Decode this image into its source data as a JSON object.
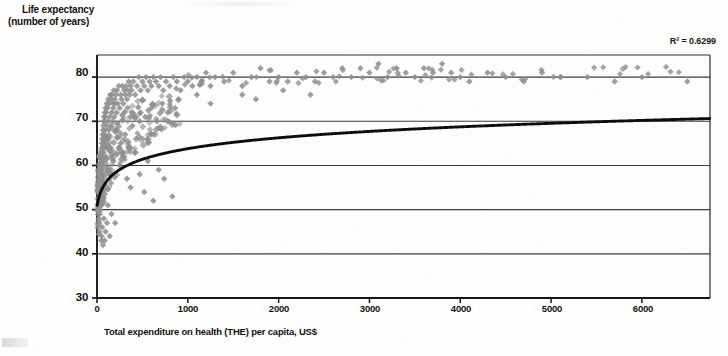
{
  "chart_data": {
    "type": "scatter",
    "title": "",
    "ylabel_lines": [
      "Life expectancy",
      "(number of years)"
    ],
    "xlabel": "Total expenditure on health (THE) per capita, US$",
    "annotation": "R² = 0.6299",
    "xlim": [
      0,
      6750
    ],
    "ylim": [
      30,
      85
    ],
    "xticks": [
      0,
      1000,
      2000,
      3000,
      4000,
      5000,
      6000
    ],
    "xticklabels": [
      "0",
      "1000",
      "2000",
      "3000",
      "4000",
      "5000",
      "6000"
    ],
    "yticks": [
      30,
      40,
      50,
      60,
      70,
      80
    ],
    "yticklabels": [
      "30",
      "40",
      "50",
      "60",
      "70",
      "80"
    ],
    "grid": "horizontal",
    "legend": "none",
    "marker": "diamond",
    "marker_color": "#8f8f8f",
    "trend_color": "#111111",
    "trend_type": "logarithmic",
    "series": [
      {
        "name": "Countries",
        "points": [
          [
            15,
            46.5
          ],
          [
            18,
            48
          ],
          [
            20,
            44.5
          ],
          [
            22,
            50
          ],
          [
            24,
            47
          ],
          [
            26,
            52
          ],
          [
            28,
            45
          ],
          [
            30,
            54
          ],
          [
            32,
            49
          ],
          [
            34,
            56
          ],
          [
            36,
            51
          ],
          [
            38,
            58
          ],
          [
            40,
            53
          ],
          [
            42,
            60
          ],
          [
            44,
            55
          ],
          [
            46,
            62
          ],
          [
            48,
            57
          ],
          [
            50,
            63
          ],
          [
            52,
            59
          ],
          [
            54,
            65
          ],
          [
            56,
            61
          ],
          [
            58,
            66
          ],
          [
            60,
            58
          ],
          [
            62,
            67
          ],
          [
            64,
            63
          ],
          [
            66,
            68
          ],
          [
            68,
            60
          ],
          [
            70,
            69
          ],
          [
            72,
            64
          ],
          [
            74,
            70
          ],
          [
            76,
            66
          ],
          [
            78,
            71
          ],
          [
            80,
            62
          ],
          [
            82,
            70
          ],
          [
            84,
            67
          ],
          [
            86,
            72
          ],
          [
            88,
            65
          ],
          [
            90,
            71
          ],
          [
            92,
            68
          ],
          [
            95,
            73
          ],
          [
            98,
            64
          ],
          [
            100,
            72
          ],
          [
            104,
            69
          ],
          [
            108,
            74
          ],
          [
            112,
            66
          ],
          [
            116,
            73
          ],
          [
            120,
            70
          ],
          [
            125,
            75
          ],
          [
            130,
            68
          ],
          [
            135,
            74
          ],
          [
            140,
            71
          ],
          [
            145,
            76
          ],
          [
            150,
            69
          ],
          [
            155,
            75
          ],
          [
            160,
            72
          ],
          [
            165,
            76
          ],
          [
            170,
            70
          ],
          [
            175,
            74
          ],
          [
            180,
            73
          ],
          [
            185,
            77
          ],
          [
            190,
            71
          ],
          [
            195,
            75
          ],
          [
            200,
            74
          ],
          [
            210,
            76
          ],
          [
            215,
            72
          ],
          [
            220,
            77
          ],
          [
            230,
            74
          ],
          [
            240,
            78
          ],
          [
            250,
            73
          ],
          [
            260,
            76
          ],
          [
            270,
            75
          ],
          [
            280,
            78
          ],
          [
            290,
            74
          ],
          [
            300,
            77
          ],
          [
            310,
            76
          ],
          [
            320,
            78
          ],
          [
            330,
            75
          ],
          [
            340,
            77
          ],
          [
            350,
            79
          ],
          [
            360,
            76
          ],
          [
            370,
            78
          ],
          [
            380,
            77
          ],
          [
            400,
            79
          ],
          [
            420,
            76
          ],
          [
            440,
            78
          ],
          [
            460,
            80
          ],
          [
            480,
            77
          ],
          [
            500,
            79
          ],
          [
            520,
            78
          ],
          [
            540,
            80
          ],
          [
            560,
            77
          ],
          [
            580,
            79
          ],
          [
            600,
            78
          ],
          [
            620,
            80
          ],
          [
            650,
            79
          ],
          [
            680,
            78
          ],
          [
            700,
            80
          ],
          [
            730,
            77
          ],
          [
            760,
            79
          ],
          [
            800,
            78
          ],
          [
            840,
            80
          ],
          [
            880,
            79
          ],
          [
            920,
            77
          ],
          [
            960,
            80
          ],
          [
            1000,
            79
          ],
          [
            1050,
            78
          ],
          [
            1100,
            80
          ],
          [
            1150,
            79
          ],
          [
            1200,
            81
          ],
          [
            1250,
            78
          ],
          [
            1300,
            80
          ],
          [
            1400,
            79
          ],
          [
            1500,
            81
          ],
          [
            1600,
            78
          ],
          [
            1700,
            80
          ],
          [
            1800,
            82
          ],
          [
            1900,
            79
          ],
          [
            2000,
            80
          ],
          [
            2100,
            79
          ],
          [
            2200,
            81
          ],
          [
            2300,
            80
          ],
          [
            2400,
            79
          ],
          [
            2500,
            81
          ],
          [
            2600,
            80
          ],
          [
            2700,
            82
          ],
          [
            2800,
            80
          ],
          [
            2900,
            82
          ],
          [
            3000,
            81
          ],
          [
            3100,
            83
          ],
          [
            3200,
            80
          ],
          [
            3300,
            82
          ],
          [
            3400,
            81
          ],
          [
            3500,
            80
          ],
          [
            3600,
            82
          ],
          [
            3700,
            81
          ],
          [
            3800,
            83
          ],
          [
            3900,
            81
          ],
          [
            4000,
            80
          ],
          [
            4100,
            79
          ],
          [
            4300,
            81
          ],
          [
            4500,
            80
          ],
          [
            4700,
            79
          ],
          [
            4900,
            81
          ],
          [
            5100,
            80
          ],
          [
            5400,
            80
          ],
          [
            5700,
            79
          ],
          [
            6000,
            80
          ],
          [
            6500,
            79
          ],
          [
            250,
            60
          ],
          [
            300,
            62
          ],
          [
            330,
            57
          ],
          [
            370,
            55
          ],
          [
            420,
            63
          ],
          [
            470,
            58
          ],
          [
            520,
            54
          ],
          [
            560,
            61
          ],
          [
            620,
            52
          ],
          [
            680,
            59
          ],
          [
            740,
            57
          ],
          [
            830,
            53
          ],
          [
            160,
            49
          ],
          [
            200,
            47
          ],
          [
            120,
            51
          ],
          [
            95,
            45
          ],
          [
            140,
            58
          ],
          [
            180,
            61
          ],
          [
            260,
            65
          ],
          [
            310,
            67
          ],
          [
            350,
            64
          ],
          [
            390,
            69
          ],
          [
            430,
            66
          ],
          [
            470,
            70
          ],
          [
            140,
            44
          ],
          [
            110,
            47
          ],
          [
            85,
            43
          ],
          [
            75,
            48
          ],
          [
            65,
            42
          ],
          [
            58,
            46
          ],
          [
            52,
            44
          ],
          [
            46,
            43
          ],
          [
            1600,
            76
          ],
          [
            1750,
            75
          ],
          [
            2050,
            77
          ],
          [
            2350,
            76
          ],
          [
            1250,
            74
          ],
          [
            900,
            75
          ],
          [
            1100,
            76
          ],
          [
            480,
            72
          ],
          [
            530,
            71
          ],
          [
            600,
            73
          ],
          [
            660,
            70
          ],
          [
            720,
            74
          ],
          [
            780,
            72
          ],
          [
            860,
            73
          ]
        ]
      }
    ],
    "trend_description": "Logarithmic fit rising steeply from ~52 at low expenditure to ~83 at the right edge"
  },
  "artifacts": {
    "scan_note": "low-quality scanned figure with speckle and edge smears"
  }
}
